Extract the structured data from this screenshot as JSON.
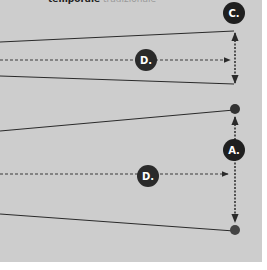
{
  "caption": {
    "bold_text": "temporale",
    "light_text": "tradizionale"
  },
  "labels": {
    "top_right": "C.",
    "top_middle": "D.",
    "bottom_right": "A.",
    "bottom_middle": "D."
  },
  "colors": {
    "panel": "#cdcdcd",
    "line": "#2a2a2a",
    "badge": "#1f1f1f",
    "badge_text": "#ffffff"
  }
}
